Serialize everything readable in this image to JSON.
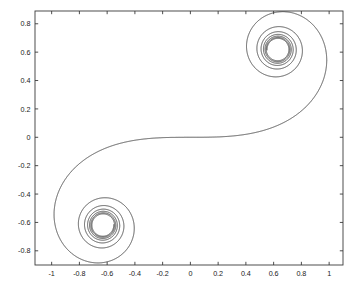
{
  "figure": {
    "title": "",
    "background_color": "#ffffff",
    "axis_color": "#3a3a3a",
    "curve_color": "#1c1c1c"
  },
  "plot_box": {
    "left_px": 35,
    "top_px": 11,
    "right_px": 343,
    "bottom_px": 265
  },
  "chart_data": {
    "type": "line",
    "title": "",
    "xlabel": "",
    "ylabel": "",
    "grid": false,
    "legend": null,
    "xlim": [
      -1.12,
      1.1
    ],
    "ylim": [
      -0.9,
      0.89
    ],
    "xticks": [
      -1,
      -0.8,
      -0.6,
      -0.4,
      -0.2,
      0,
      0.2,
      0.4,
      0.6,
      0.8,
      1
    ],
    "xticklabels": [
      "-1",
      "-0.8",
      "-0.6",
      "-0.4",
      "-0.2",
      "0",
      "0.2",
      "0.4",
      "0.6",
      "0.8",
      "1"
    ],
    "yticks": [
      0.8,
      0.6,
      0.4,
      0.2,
      0,
      -0.2,
      -0.4,
      -0.6,
      -0.8
    ],
    "yticklabels": [
      "0.8",
      "0.6",
      "0.4",
      "0.2",
      "0",
      "-0.2",
      "-0.4",
      "-0.6",
      "-0.8"
    ],
    "series": [
      {
        "name": "cornu-spiral",
        "description": "Cornu (Euler) clothoid double spiral converging to two focal points",
        "focus_points": [
          [
            0.63,
            0.62
          ],
          [
            -0.63,
            -0.62
          ]
        ],
        "passes_through_origin": true,
        "windings_per_arm": 9
      }
    ]
  }
}
